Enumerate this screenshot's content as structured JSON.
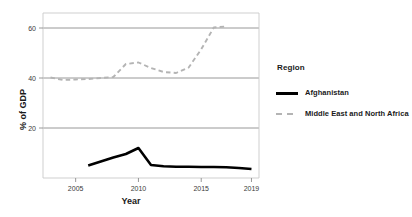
{
  "chart_data": {
    "type": "line",
    "title": "",
    "xlabel": "Year",
    "ylabel": "% of GDP",
    "xlim": [
      2002.4,
      2019.6
    ],
    "ylim": [
      0,
      66
    ],
    "xticks": [
      2005,
      2010,
      2015,
      2019
    ],
    "xtick_labels": [
      "2005",
      "2010",
      "2015",
      "2019"
    ],
    "yticks": [
      20,
      40,
      60
    ],
    "ytick_labels": [
      "20",
      "40",
      "60"
    ],
    "grid": "horizontal",
    "legend_position": "right",
    "legend_title": "Region",
    "series": [
      {
        "name": "Afghanistan",
        "style": "solid",
        "color": "#000000",
        "width": 2.6,
        "x": [
          2006,
          2007,
          2008,
          2009,
          2010,
          2011,
          2012,
          2013,
          2014,
          2015,
          2016,
          2017,
          2018,
          2019
        ],
        "values": [
          5.0,
          6.6,
          8.2,
          9.6,
          12.0,
          5.2,
          4.7,
          4.5,
          4.5,
          4.4,
          4.4,
          4.3,
          4.0,
          3.6
        ]
      },
      {
        "name": "Middle East and North Africa",
        "style": "dashed",
        "color": "#b4b4b4",
        "width": 1.9,
        "x": [
          2003,
          2004,
          2005,
          2006,
          2007,
          2008,
          2009,
          2010,
          2011,
          2012,
          2013,
          2014,
          2015,
          2016,
          2017
        ],
        "values": [
          40.2,
          39.2,
          39.4,
          39.6,
          40.0,
          40.4,
          45.6,
          46.2,
          44.0,
          42.4,
          42.0,
          44.2,
          51.5,
          60.2,
          60.6
        ]
      }
    ]
  },
  "legend": {
    "title": "Region",
    "items": [
      {
        "label": "Afghanistan",
        "marker": "solid-line-swatch",
        "color": "#000000"
      },
      {
        "label": "Middle East and North Africa",
        "marker": "dashed-line-swatch",
        "color": "#b4b4b4"
      }
    ]
  },
  "axes": {
    "x_title": "Year",
    "y_title": "% of GDP"
  }
}
